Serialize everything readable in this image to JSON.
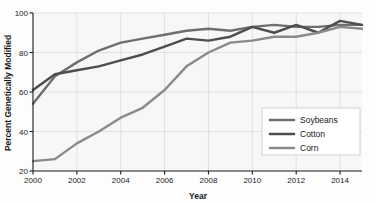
{
  "chart_data": {
    "type": "line",
    "title": "",
    "xlabel": "Year",
    "ylabel": "Percent Genetically Modified",
    "xlim": [
      2000,
      2015
    ],
    "ylim": [
      20,
      100
    ],
    "xticks": [
      2000,
      2002,
      2004,
      2006,
      2008,
      2010,
      2012,
      2014
    ],
    "xtick_labels": [
      "2000",
      "2002",
      "2004",
      "2006",
      "2008",
      "2010",
      "2012",
      "2014"
    ],
    "yticks": [
      20,
      40,
      60,
      80,
      100
    ],
    "ytick_labels": [
      "20",
      "40",
      "60",
      "80",
      "100"
    ],
    "grid": true,
    "legend_position": "lower right",
    "x": [
      2000,
      2001,
      2002,
      2003,
      2004,
      2005,
      2006,
      2007,
      2008,
      2009,
      2010,
      2011,
      2012,
      2013,
      2014,
      2015
    ],
    "series": [
      {
        "name": "Soybeans",
        "color": "#6e6e6e",
        "values": [
          54,
          68,
          75,
          81,
          85,
          87,
          89,
          91,
          92,
          91,
          93,
          94,
          93,
          93,
          94,
          94
        ]
      },
      {
        "name": "Cotton",
        "color": "#4d4d4d",
        "values": [
          61,
          69,
          71,
          73,
          76,
          79,
          83,
          87,
          86,
          88,
          93,
          90,
          94,
          90,
          96,
          94
        ]
      },
      {
        "name": "Corn",
        "color": "#8a8a8a",
        "values": [
          25,
          26,
          34,
          40,
          47,
          52,
          61,
          73,
          80,
          85,
          86,
          88,
          88,
          90,
          93,
          92
        ]
      }
    ]
  },
  "legend": {
    "items": [
      {
        "label": "Soybeans"
      },
      {
        "label": "Cotton"
      },
      {
        "label": "Corn"
      }
    ]
  },
  "colors": {
    "soybeans": "#6e6e6e",
    "cotton": "#4d4d4d",
    "corn": "#8a8a8a",
    "grid": "#d7d7d7",
    "axis": "#1a1a1a",
    "plot_background": "#f7f7f7",
    "figure_background": "#fdfdfd",
    "legend_background": "#ffffff",
    "legend_border": "#c9c9c9"
  }
}
